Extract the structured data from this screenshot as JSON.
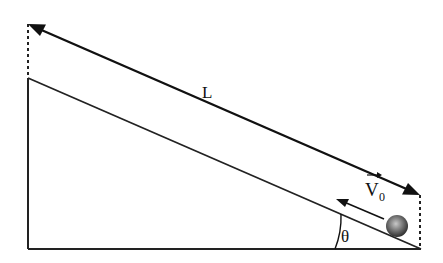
{
  "diagram": {
    "type": "inclined-plane",
    "labels": {
      "length": "L",
      "velocity": "V",
      "velocity_subscript": "0",
      "angle": "θ"
    },
    "colors": {
      "stroke": "#111111",
      "ball_light": "#bdbdbd",
      "ball_dark": "#3a3a3a"
    },
    "elements": [
      "incline-surface",
      "ground-line",
      "vertical-wall",
      "length-arrow-L",
      "dashed-guide-left",
      "dashed-guide-right",
      "ball",
      "velocity-arrow-v0",
      "angle-arc-theta"
    ]
  }
}
